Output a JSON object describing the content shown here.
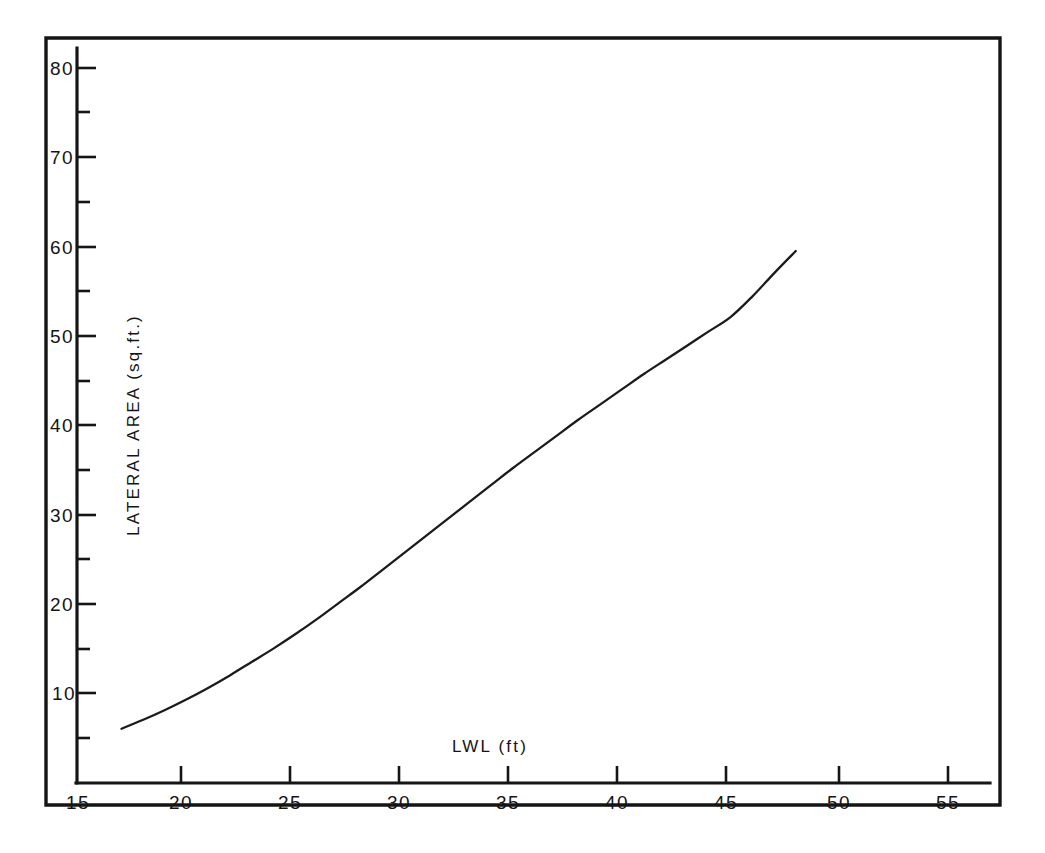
{
  "chart_data": {
    "type": "line",
    "title": "",
    "subtitle": "",
    "xlabel": "LWL (ft)",
    "ylabel": "LATERAL AREA (sq.ft.)",
    "xlim": [
      15,
      57
    ],
    "ylim": [
      0,
      82
    ],
    "grid": false,
    "legend": null,
    "x_ticks_major": [
      15,
      20,
      25,
      30,
      35,
      40,
      45,
      50,
      55
    ],
    "x_tick_labels": [
      "15",
      "20",
      "25",
      "30",
      "35",
      "40",
      "45",
      "50",
      "55"
    ],
    "y_ticks_major": [
      10,
      20,
      30,
      40,
      50,
      60,
      70,
      80
    ],
    "y_tick_labels": [
      "10",
      "20",
      "30",
      "40",
      "50",
      "60",
      "70",
      "80"
    ],
    "y_ticks_minor": [
      5,
      15,
      25,
      35,
      45,
      55,
      65,
      75
    ],
    "series": [
      {
        "name": "Lateral Area",
        "color": "#1b1b1b",
        "x": [
          17.0,
          18.0,
          19.0,
          20.0,
          21.0,
          22.0,
          23.0,
          24.0,
          25.0,
          26.0,
          27.0,
          28.0,
          29.0,
          30.0,
          31.0,
          32.0,
          33.0,
          34.0,
          35.0,
          36.0,
          37.0,
          38.0,
          39.0,
          40.0,
          41.0,
          42.0,
          43.0,
          44.0,
          45.0,
          46.0,
          47.0,
          48.0
        ],
        "y": [
          6.0,
          7.0,
          8.1,
          9.3,
          10.6,
          12.0,
          13.5,
          15.0,
          16.6,
          18.3,
          20.1,
          21.9,
          23.8,
          25.7,
          27.6,
          29.5,
          31.4,
          33.3,
          35.2,
          37.0,
          38.8,
          40.6,
          42.3,
          44.0,
          45.7,
          47.3,
          48.9,
          50.5,
          52.1,
          54.4,
          57.0,
          59.5
        ]
      }
    ]
  },
  "axis": {
    "x_title": "LWL (ft)",
    "y_title": "LATERAL AREA (sq.ft.)"
  }
}
